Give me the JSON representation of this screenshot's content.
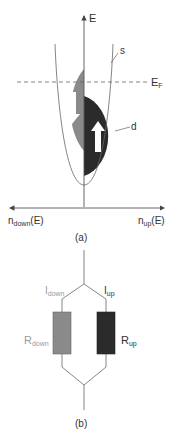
{
  "panel_a": {
    "energy_axis_label": "E",
    "fermi_label_main": "E",
    "fermi_label_sub": "F",
    "s_band_label": "s",
    "d_band_label": "d",
    "x_left_label_main": "n",
    "x_left_label_sub": "down",
    "x_left_label_tail": "(E)",
    "x_right_label_main": "n",
    "x_right_label_sub": "up",
    "x_right_label_tail": "(E)",
    "caption": "(a)"
  },
  "panel_b": {
    "i_down_main": "I",
    "i_down_sub": "down",
    "i_up_main": "I",
    "i_up_sub": "up",
    "r_down_main": "R",
    "r_down_sub": "down",
    "r_up_main": "R",
    "r_up_sub": "up",
    "caption": "(b)"
  },
  "colors": {
    "spin_down_fill": "#8a8a8a",
    "spin_up_fill": "#2b2b2b",
    "line": "#555555"
  }
}
